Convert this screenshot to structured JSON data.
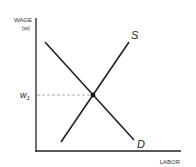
{
  "diagram": {
    "y_axis_label": "WAGE",
    "y_axis_sublabel": "(w)",
    "x_axis_label": "LABOR",
    "equilibrium_label": "w",
    "equilibrium_subscript": "1",
    "supply_label": "S",
    "demand_label": "D"
  }
}
